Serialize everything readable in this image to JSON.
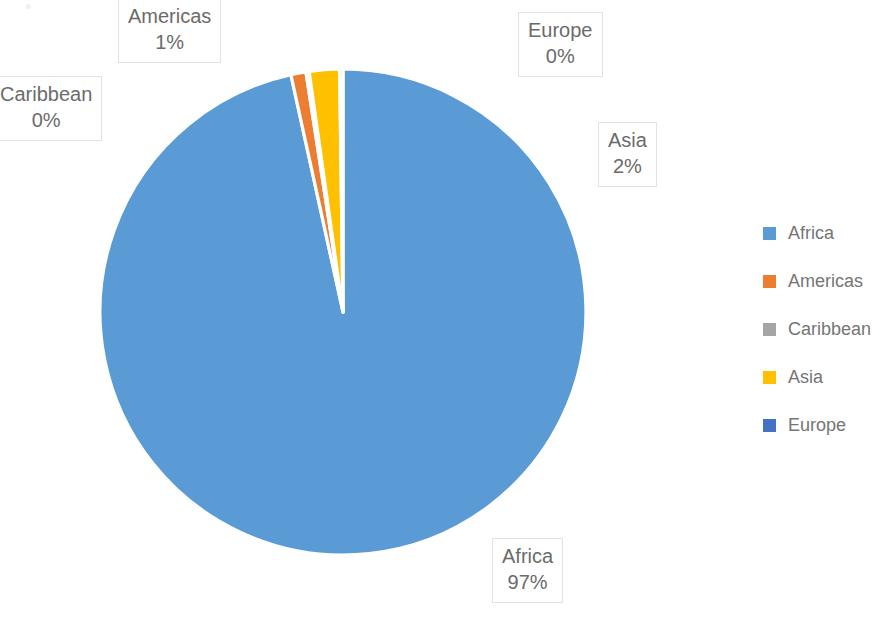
{
  "chart_data": {
    "type": "pie",
    "title": "",
    "subtitle": "",
    "xlabel": "",
    "ylabel": "",
    "grid": false,
    "legend_position": "right",
    "categories": [
      "Africa",
      "Americas",
      "Caribbean",
      "Asia",
      "Europe"
    ],
    "values": [
      97,
      1,
      0,
      2,
      0
    ],
    "value_unit": "%",
    "slice_colors": [
      "#5B9BD5",
      "#ED7D31",
      "#A5A5A5",
      "#FFC000",
      "#4472C4"
    ],
    "slice_order_clockwise_from_top": [
      "Africa",
      "Americas",
      "Caribbean",
      "Asia",
      "Europe"
    ],
    "slice_border_color": "#FFFFFF",
    "data_labels": [
      {
        "name": "Africa",
        "value": "97%"
      },
      {
        "name": "Americas",
        "value": "1%"
      },
      {
        "name": "Caribbean",
        "value": "0%"
      },
      {
        "name": "Asia",
        "value": "2%"
      },
      {
        "name": "Europe",
        "value": "0%"
      }
    ]
  },
  "labels": {
    "africa": {
      "name": "Africa",
      "value": "97%"
    },
    "americas": {
      "name": "Americas",
      "value": "1%"
    },
    "caribbean": {
      "name": "Caribbean",
      "value": "0%"
    },
    "asia": {
      "name": "Asia",
      "value": "2%"
    },
    "europe": {
      "name": "Europe",
      "value": "0%"
    }
  },
  "legend": {
    "items": [
      {
        "label": "Africa",
        "color": "#5B9BD5"
      },
      {
        "label": "Americas",
        "color": "#ED7D31"
      },
      {
        "label": "Caribbean",
        "color": "#A5A5A5"
      },
      {
        "label": "Asia",
        "color": "#FFC000"
      },
      {
        "label": "Europe",
        "color": "#4472C4"
      }
    ]
  },
  "colors": {
    "africa": "#5B9BD5",
    "americas": "#ED7D31",
    "caribbean": "#A5A5A5",
    "asia": "#FFC000",
    "europe": "#4472C4",
    "label_text": "#6b6b6b",
    "label_border": "#e2e2e2",
    "legend_text": "#757575",
    "background": "#FFFFFF"
  }
}
